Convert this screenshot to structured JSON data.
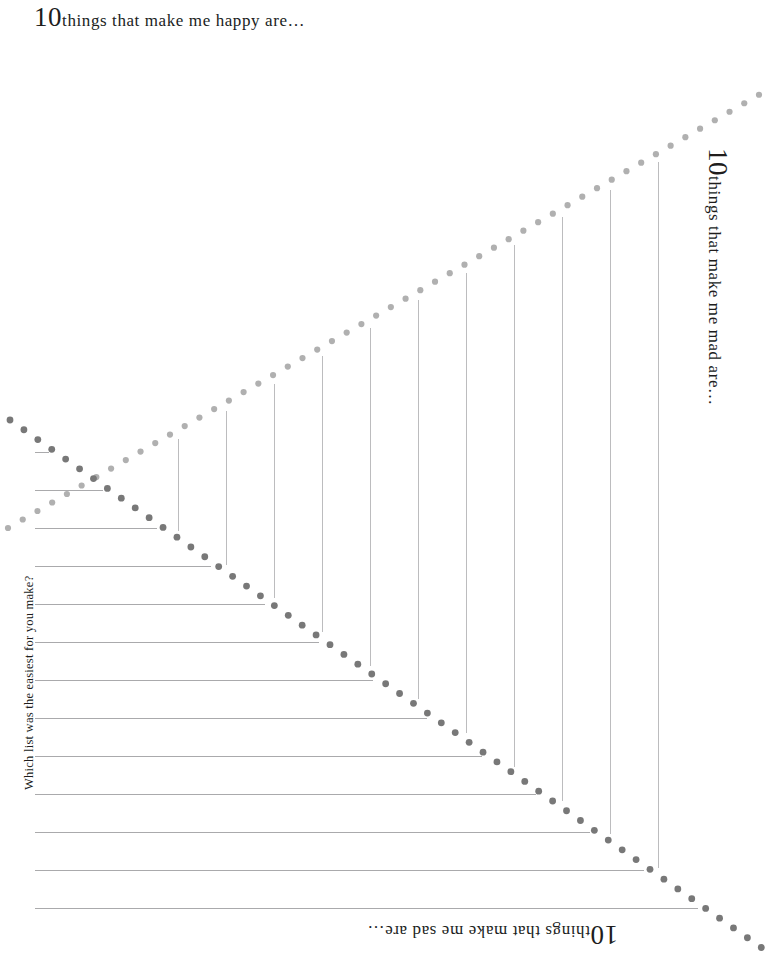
{
  "page": {
    "width": 766,
    "height": 959,
    "background": "#ffffff"
  },
  "headings": {
    "happy": {
      "number": "10",
      "rest": "things that make me happy are…",
      "full": "10 things that make me happy are…",
      "rotation": 0,
      "position": "top-left"
    },
    "mad": {
      "number": "10",
      "rest": "things that make me mad are…",
      "full": "10 things that make me mad are…",
      "rotation": 90,
      "position": "right"
    },
    "sad": {
      "number": "10",
      "rest": "things that make me sad are…",
      "full": "10 things that make me sad are…",
      "rotation": 180,
      "position": "bottom"
    },
    "question": {
      "text": "Which list was the easiest for you make?",
      "rotation": -90,
      "position": "left"
    }
  },
  "colors": {
    "ink": "#201d1c",
    "rule": "#aaaaac",
    "vrule": "#bcbcbe",
    "dot_dark": "#787878",
    "dot_light": "#b0b0b0",
    "paper": "#ffffff"
  },
  "layout": {
    "horizontal_rules": {
      "count": 23,
      "start_x": 35,
      "first_y": 72,
      "spacing": 38,
      "note": "each rule runs from the left margin until it meets the dark dotted diagonal"
    },
    "vertical_rules": {
      "count": 11,
      "first_x": 178,
      "spacing": 48,
      "note": "each rule hangs from the light dotted diagonal down to the dark dotted diagonal"
    },
    "diagonals": [
      {
        "name": "light-diagonal",
        "color": "#b0b0b0",
        "from": [
          8,
          528
        ],
        "to": [
          762,
          93
        ],
        "dot_radius": 3.1,
        "dot_spacing": 17
      },
      {
        "name": "dark-diagonal",
        "color": "#787878",
        "from": [
          10,
          420
        ],
        "to": [
          762,
          948
        ],
        "dot_radius": 3.4,
        "dot_spacing": 17
      }
    ]
  }
}
